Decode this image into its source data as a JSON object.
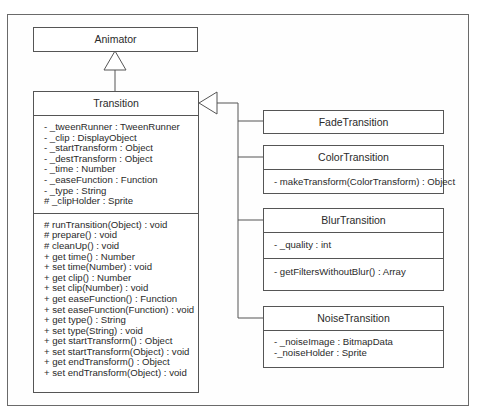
{
  "diagram": {
    "type": "uml-class-diagram",
    "classes": {
      "animator": {
        "name": "Animator"
      },
      "transition": {
        "name": "Transition",
        "attributes": [
          "- _tweenRunner : TweenRunner",
          "- _clip : DisplayObject",
          "- _startTransform : Object",
          "- _destTransform : Object",
          "- _time : Number",
          "- _easeFunction : Function",
          "- _type :  String",
          "# _clipHolder : Sprite"
        ],
        "methods": [
          "# runTransition(Object) : void",
          "# prepare() : void",
          "# cleanUp() : void",
          "+ get time() : Number",
          "+ set time(Number) : void",
          "+ get clip() : Number",
          "+ set clip(Number) : void",
          "+ get easeFunction() : Function",
          "+ set easeFunction(Function) : void",
          "+ get type() : String",
          "+ set type(String) : void",
          "+ get startTransform() : Object",
          "+ set startTransform(Object) : void",
          "+ get endTransform() : Object",
          "+ set endTransform(Object) : void"
        ]
      },
      "fade": {
        "name": "FadeTransition"
      },
      "color": {
        "name": "ColorTransition",
        "methods": [
          "- makeTransform(ColorTransform) : Object"
        ]
      },
      "blur": {
        "name": "BlurTransition",
        "attributes": [
          "- _quality : int"
        ],
        "methods": [
          "- getFiltersWithoutBlur() : Array"
        ]
      },
      "noise": {
        "name": "NoiseTransition",
        "attributes": [
          "- _noiseImage : BitmapData",
          "-_noiseHolder : Sprite"
        ]
      }
    },
    "relationships": [
      {
        "type": "generalization",
        "from": "Transition",
        "to": "Animator"
      },
      {
        "type": "generalization",
        "from": "FadeTransition",
        "to": "Transition"
      },
      {
        "type": "generalization",
        "from": "ColorTransition",
        "to": "Transition"
      },
      {
        "type": "generalization",
        "from": "BlurTransition",
        "to": "Transition"
      },
      {
        "type": "generalization",
        "from": "NoiseTransition",
        "to": "Transition"
      }
    ]
  }
}
